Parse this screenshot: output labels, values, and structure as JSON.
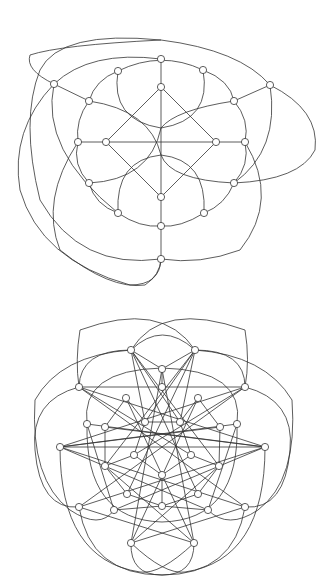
{
  "node_radius": 3.6,
  "colors": {
    "stroke": "#333333",
    "node_fill": "#ffffff",
    "background": "#ffffff"
  },
  "graphs": [
    {
      "name": "top-graph",
      "nodes": [
        [
          161,
          59
        ],
        [
          118,
          71
        ],
        [
          203,
          70
        ],
        [
          54,
          84
        ],
        [
          270,
          85
        ],
        [
          89,
          101
        ],
        [
          234,
          101
        ],
        [
          161,
          87
        ],
        [
          78,
          142
        ],
        [
          106,
          142
        ],
        [
          216,
          142
        ],
        [
          245,
          142
        ],
        [
          89,
          183
        ],
        [
          234,
          183
        ],
        [
          161,
          197
        ],
        [
          118,
          213
        ],
        [
          204,
          213
        ],
        [
          161,
          226
        ],
        [
          161,
          259
        ]
      ],
      "lines": [
        [
          161,
          59,
          161,
          87
        ],
        [
          54,
          84,
          89,
          101
        ],
        [
          270,
          85,
          234,
          101
        ],
        [
          78,
          142,
          106,
          142
        ],
        [
          216,
          142,
          245,
          142
        ],
        [
          161,
          226,
          161,
          259
        ],
        [
          161,
          197,
          161,
          226
        ],
        [
          161,
          87,
          106,
          142
        ],
        [
          161,
          87,
          216,
          142
        ],
        [
          161,
          197,
          106,
          142
        ],
        [
          161,
          197,
          216,
          142
        ],
        [
          106,
          142,
          216,
          142
        ],
        [
          161,
          87,
          161,
          197
        ]
      ],
      "paths": [
        "M118,71 Q161,50 203,70",
        "M203,70 Q230,80 234,101",
        "M234,101 Q250,120 245,142",
        "M245,142 Q250,165 234,183",
        "M234,183 Q225,205 204,213",
        "M204,213 Q180,228 161,226",
        "M161,226 Q140,228 118,213",
        "M118,213 Q95,205 89,183",
        "M89,183 Q72,165 78,142",
        "M78,142 Q75,120 89,101",
        "M89,101 Q95,80 118,71",
        "M118,71 Q110,120 161,128 Q212,120 203,70",
        "M89,183 Q150,180 161,128",
        "M234,183 Q170,180 161,155",
        "M118,213 Q115,160 161,155 Q207,160 204,213",
        "M89,101 Q150,110 161,155",
        "M234,101 Q175,110 161,128",
        "M54,84 Q90,50 161,59",
        "M270,85 Q240,50 161,40 Q60,45 30,55 Q25,70 54,84",
        "M270,85 Q280,150 234,183",
        "M54,84 Q40,150 118,213",
        "M78,142 Q40,200 60,250 Q110,290 145,285 Q160,275 161,259",
        "M245,142 Q280,200 240,250 Q200,265 161,259",
        "M270,85 Q320,110 315,150 Q300,180 234,183",
        "M54,84 Q10,130 20,190 Q40,260 130,285 Q160,285 161,259",
        "M161,40 Q60,30 40,70 Q20,120 40,200 Q80,270 161,259"
      ]
    },
    {
      "name": "bottom-graph",
      "nodes": [
        [
          131,
          350
        ],
        [
          195,
          350
        ],
        [
          162,
          369
        ],
        [
          79,
          387
        ],
        [
          245,
          387
        ],
        [
          162,
          387
        ],
        [
          126,
          398
        ],
        [
          198,
          398
        ],
        [
          87,
          424
        ],
        [
          105,
          427
        ],
        [
          145,
          422
        ],
        [
          180,
          422
        ],
        [
          220,
          427
        ],
        [
          237,
          424
        ],
        [
          60,
          447
        ],
        [
          265,
          447
        ],
        [
          134,
          455
        ],
        [
          191,
          455
        ],
        [
          105,
          466
        ],
        [
          219,
          466
        ],
        [
          162,
          475
        ],
        [
          127,
          494
        ],
        [
          198,
          494
        ],
        [
          79,
          507
        ],
        [
          114,
          510
        ],
        [
          162,
          506
        ],
        [
          208,
          510
        ],
        [
          245,
          507
        ],
        [
          131,
          543
        ],
        [
          194,
          543
        ]
      ],
      "lines": [
        [
          131,
          350,
          162,
          369
        ],
        [
          195,
          350,
          162,
          369
        ],
        [
          162,
          369,
          162,
          387
        ],
        [
          79,
          387,
          245,
          387
        ],
        [
          131,
          350,
          145,
          422
        ],
        [
          131,
          350,
          180,
          422
        ],
        [
          195,
          350,
          145,
          422
        ],
        [
          195,
          350,
          180,
          422
        ],
        [
          131,
          350,
          198,
          494
        ],
        [
          195,
          350,
          127,
          494
        ],
        [
          131,
          350,
          219,
          466
        ],
        [
          195,
          350,
          105,
          466
        ],
        [
          79,
          387,
          265,
          447
        ],
        [
          245,
          387,
          60,
          447
        ],
        [
          79,
          387,
          191,
          455
        ],
        [
          245,
          387,
          134,
          455
        ],
        [
          60,
          447,
          265,
          447
        ],
        [
          60,
          447,
          237,
          424
        ],
        [
          265,
          447,
          87,
          424
        ],
        [
          60,
          447,
          220,
          427
        ],
        [
          265,
          447,
          105,
          427
        ],
        [
          60,
          447,
          245,
          507
        ],
        [
          265,
          447,
          79,
          507
        ],
        [
          60,
          447,
          208,
          510
        ],
        [
          265,
          447,
          114,
          510
        ],
        [
          79,
          507,
          245,
          387
        ],
        [
          245,
          507,
          79,
          387
        ],
        [
          79,
          507,
          194,
          543
        ],
        [
          245,
          507,
          131,
          543
        ],
        [
          131,
          543,
          162,
          369
        ],
        [
          194,
          543,
          162,
          369
        ],
        [
          131,
          543,
          198,
          398
        ],
        [
          194,
          543,
          126,
          398
        ],
        [
          131,
          543,
          219,
          466
        ],
        [
          194,
          543,
          105,
          466
        ],
        [
          162,
          475,
          162,
          506
        ],
        [
          127,
          494,
          162,
          506
        ],
        [
          198,
          494,
          162,
          506
        ],
        [
          126,
          398,
          145,
          422
        ],
        [
          198,
          398,
          180,
          422
        ],
        [
          126,
          398,
          105,
          427
        ],
        [
          198,
          398,
          220,
          427
        ],
        [
          105,
          427,
          105,
          466
        ],
        [
          220,
          427,
          219,
          466
        ],
        [
          105,
          466,
          127,
          494
        ],
        [
          219,
          466,
          198,
          494
        ],
        [
          145,
          422,
          134,
          455
        ],
        [
          180,
          422,
          191,
          455
        ],
        [
          134,
          455,
          162,
          475
        ],
        [
          191,
          455,
          162,
          475
        ],
        [
          134,
          455,
          105,
          466
        ],
        [
          191,
          455,
          219,
          466
        ],
        [
          145,
          422,
          180,
          422
        ],
        [
          87,
          424,
          114,
          510
        ],
        [
          237,
          424,
          208,
          510
        ],
        [
          114,
          510,
          162,
          506
        ],
        [
          208,
          510,
          162,
          506
        ]
      ],
      "paths": [
        "M79,387 Q80,350 131,350",
        "M245,387 Q245,350 195,350",
        "M131,350 Q162,320 195,350",
        "M131,350 Q162,300 245,330 Q250,360 245,387",
        "M195,350 Q162,300 80,330 Q75,360 79,387",
        "M79,387 Q30,400 35,450 Q40,510 79,507",
        "M245,387 Q295,400 290,450 Q285,510 245,507",
        "M131,350 Q60,355 35,400 Q30,480 70,510 Q100,530 114,510",
        "M195,350 Q265,355 292,400 Q298,480 258,510 Q228,530 208,510",
        "M131,543 Q130,575 162,575 Q194,575 194,543",
        "M79,507 Q90,575 162,575 Q234,575 245,507",
        "M60,447 Q60,560 140,572 Q160,575 194,543",
        "M265,447 Q265,560 185,572 Q165,575 131,543",
        "M87,424 Q80,370 162,368 Q245,370 237,424",
        "M87,424 Q85,520 162,522 Q240,520 237,424"
      ]
    }
  ]
}
